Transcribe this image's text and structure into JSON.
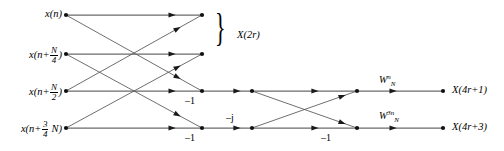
{
  "figure": {
    "type": "signal-flow-graph",
    "canvas": {
      "width": 504,
      "height": 151
    },
    "line_color": "#6b6b6b",
    "node_color": "#111111",
    "text_color": "#000000"
  },
  "inputs": [
    {
      "id": "in0",
      "prefix": "x(n",
      "num": "",
      "den": "",
      "suffix": ")",
      "plain": "x(n)",
      "x": 66,
      "y": 15,
      "label_x": 62,
      "label_y": 9,
      "has_fraction": false
    },
    {
      "id": "in1",
      "prefix": "x(n+",
      "num": "N",
      "den": "4",
      "suffix": ")",
      "plain": "x(n+N/4)",
      "x": 66,
      "y": 54,
      "label_x": 62,
      "label_y": 46,
      "has_fraction": true
    },
    {
      "id": "in2",
      "prefix": "x(n+",
      "num": "N",
      "den": "2",
      "suffix": ")",
      "plain": "x(n+N/2)",
      "x": 66,
      "y": 91,
      "label_x": 62,
      "label_y": 83,
      "has_fraction": true
    },
    {
      "id": "in3",
      "prefix": "x(n+",
      "num": "3",
      "den": "4",
      "suffix": " N)",
      "plain": "x(n+3N/4)",
      "x": 66,
      "y": 128,
      "label_x": 62,
      "label_y": 120,
      "has_fraction": true
    }
  ],
  "stage_nodes": {
    "stage1_x": 202,
    "stage2_x": 252,
    "stage3_x": 357,
    "output_x": 443,
    "rows_y": [
      15,
      54,
      91,
      128
    ]
  },
  "coefficients": [
    {
      "id": "c-minus1-row3",
      "text": "–1",
      "x": 185,
      "y": 96,
      "name": "coefficient-minus-one-row3"
    },
    {
      "id": "c-minus1-row4",
      "text": "–1",
      "x": 185,
      "y": 133,
      "name": "coefficient-minus-one-row4"
    },
    {
      "id": "c-minusj",
      "text": "–j",
      "x": 226,
      "y": 113,
      "name": "coefficient-minus-j"
    },
    {
      "id": "c-minus1-row4b",
      "text": "–1",
      "x": 321,
      "y": 133,
      "name": "coefficient-minus-one-stage3"
    }
  ],
  "twiddles": [
    {
      "id": "w-n",
      "base": "W",
      "sub": "N",
      "sup": "n",
      "plain": "W_N^n",
      "x": 379,
      "y": 74,
      "name": "twiddle-w-n"
    },
    {
      "id": "w-3n",
      "base": "W",
      "sub": "N",
      "sup": "3n",
      "plain": "W_N^3n",
      "x": 379,
      "y": 110,
      "name": "twiddle-w-3n"
    }
  ],
  "brace": {
    "glyph": "}",
    "x": 215,
    "y": 8,
    "label": "X(2r)",
    "label_x": 237,
    "label_y": 30
  },
  "outputs": [
    {
      "id": "out1",
      "label": "X(4r+1)",
      "x": 443,
      "y": 91,
      "label_x": 452,
      "label_y": 85
    },
    {
      "id": "out3",
      "label": "X(4r+3)",
      "x": 443,
      "y": 128,
      "label_x": 452,
      "label_y": 122
    }
  ],
  "chart_data": {
    "type": "diagram",
    "nodes_columns_x": [
      66,
      202,
      252,
      357,
      443
    ],
    "rows_y": [
      15,
      54,
      91,
      128
    ],
    "edges": [
      {
        "from": [
          66,
          15
        ],
        "to": [
          202,
          15
        ],
        "type": "straight",
        "arrow_at": 0.78
      },
      {
        "from": [
          66,
          54
        ],
        "to": [
          202,
          54
        ],
        "type": "straight",
        "arrow_at": 0.78
      },
      {
        "from": [
          66,
          91
        ],
        "to": [
          202,
          91
        ],
        "type": "straight",
        "arrow_at": 0.78
      },
      {
        "from": [
          66,
          128
        ],
        "to": [
          202,
          128
        ],
        "type": "straight",
        "arrow_at": 0.78
      },
      {
        "from": [
          66,
          15
        ],
        "to": [
          202,
          91
        ],
        "type": "cross",
        "arrow_at": 0.82
      },
      {
        "from": [
          66,
          54
        ],
        "to": [
          202,
          128
        ],
        "type": "cross",
        "arrow_at": 0.82
      },
      {
        "from": [
          66,
          91
        ],
        "to": [
          202,
          15
        ],
        "type": "cross",
        "arrow_at": 0.82
      },
      {
        "from": [
          66,
          128
        ],
        "to": [
          202,
          54
        ],
        "type": "cross",
        "arrow_at": 0.82
      },
      {
        "from": [
          202,
          91
        ],
        "to": [
          252,
          91
        ],
        "type": "straight",
        "arrow_at": 0.7
      },
      {
        "from": [
          202,
          128
        ],
        "to": [
          252,
          128
        ],
        "type": "straight",
        "arrow_at": 0.7
      },
      {
        "from": [
          252,
          91
        ],
        "to": [
          357,
          91
        ],
        "type": "straight",
        "arrow_at": 0.6
      },
      {
        "from": [
          252,
          128
        ],
        "to": [
          357,
          128
        ],
        "type": "straight",
        "arrow_at": 0.6
      },
      {
        "from": [
          252,
          91
        ],
        "to": [
          357,
          128
        ],
        "type": "cross",
        "arrow_at": 0.86
      },
      {
        "from": [
          252,
          128
        ],
        "to": [
          357,
          91
        ],
        "type": "cross",
        "arrow_at": 0.86
      },
      {
        "from": [
          357,
          91
        ],
        "to": [
          443,
          91
        ],
        "type": "straight",
        "arrow_at": 0.42
      },
      {
        "from": [
          357,
          128
        ],
        "to": [
          443,
          128
        ],
        "type": "straight",
        "arrow_at": 0.42
      }
    ]
  }
}
